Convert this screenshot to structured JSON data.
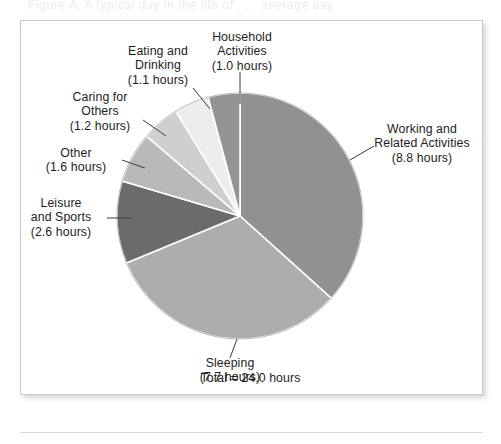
{
  "figure": {
    "caption_ghost": "Figure      A. A typical day in the life of . . .   average  day",
    "total_label": "Total = 24.0 hours",
    "frame_color": "#c9c9c9",
    "background": "#ffffff",
    "text_color": "#1d1d1d"
  },
  "chart_data": {
    "type": "pie",
    "title": "",
    "unit": "hours",
    "total": 24.0,
    "total_label": "Total = 24.0 hours",
    "legend": "none",
    "labels_position": "outside-with-leader-lines",
    "start_angle_deg": 0,
    "direction": "clockwise",
    "categories": [
      "Working and Related Activities",
      "Sleeping",
      "Leisure and Sports",
      "Other",
      "Caring for Others",
      "Eating and Drinking",
      "Household Activities"
    ],
    "values": [
      8.8,
      7.7,
      2.6,
      1.6,
      1.2,
      1.1,
      1.0
    ],
    "slices": [
      {
        "name": "Working and Related Activities",
        "label_line1": "Working and",
        "label_line2": "Related Activities",
        "label_line3": "(8.8 hours)",
        "value": 8.8,
        "value_text": "8.8 hours",
        "percent": 36.7,
        "angle_deg": 132.0,
        "color": "#919191"
      },
      {
        "name": "Sleeping",
        "label_line1": "Sleeping",
        "label_line2": "(7.7 hours)",
        "label_line3": "",
        "value": 7.7,
        "value_text": "7.7 hours",
        "percent": 32.1,
        "angle_deg": 115.5,
        "color": "#adadad"
      },
      {
        "name": "Leisure and Sports",
        "label_line1": "Leisure",
        "label_line2": "and Sports",
        "label_line3": "(2.6 hours)",
        "value": 2.6,
        "value_text": "2.6 hours",
        "percent": 10.8,
        "angle_deg": 39.0,
        "color": "#6b6b6b"
      },
      {
        "name": "Other",
        "label_line1": "Other",
        "label_line2": "(1.6 hours)",
        "label_line3": "",
        "value": 1.6,
        "value_text": "1.6 hours",
        "percent": 6.7,
        "angle_deg": 24.0,
        "color": "#b9b9b9"
      },
      {
        "name": "Caring for Others",
        "label_line1": "Caring for",
        "label_line2": "Others",
        "label_line3": "(1.2 hours)",
        "value": 1.2,
        "value_text": "1.2 hours",
        "percent": 5.0,
        "angle_deg": 18.0,
        "color": "#cfcfcf"
      },
      {
        "name": "Eating and Drinking",
        "label_line1": "Eating and",
        "label_line2": "Drinking",
        "label_line3": "(1.1 hours)",
        "value": 1.1,
        "value_text": "1.1 hours",
        "percent": 4.6,
        "angle_deg": 16.5,
        "color": "#ededed"
      },
      {
        "name": "Household Activities",
        "label_line1": "Household",
        "label_line2": "Activities",
        "label_line3": "(1.0 hours)",
        "value": 1.0,
        "value_text": "1.0 hours",
        "percent": 4.2,
        "angle_deg": 15.0,
        "color": "#949494"
      }
    ],
    "geometry": {
      "cx": 240,
      "cy": 216,
      "r": 123,
      "separator_color": "#ffffff",
      "separator_width": 1.6,
      "leader_color": "#3a3a3a"
    }
  },
  "labels": {
    "household": "Household\nActivities\n(1.0 hours)",
    "eating": "Eating and\nDrinking\n(1.1 hours)",
    "caring": "Caring for\nOthers\n(1.2 hours)",
    "other": "Other\n(1.6 hours)",
    "leisure": "Leisure\nand Sports\n(2.6 hours)",
    "sleeping": "Sleeping\n(7.7 hours)",
    "working": "Working and\nRelated Activities\n(8.8 hours)"
  }
}
